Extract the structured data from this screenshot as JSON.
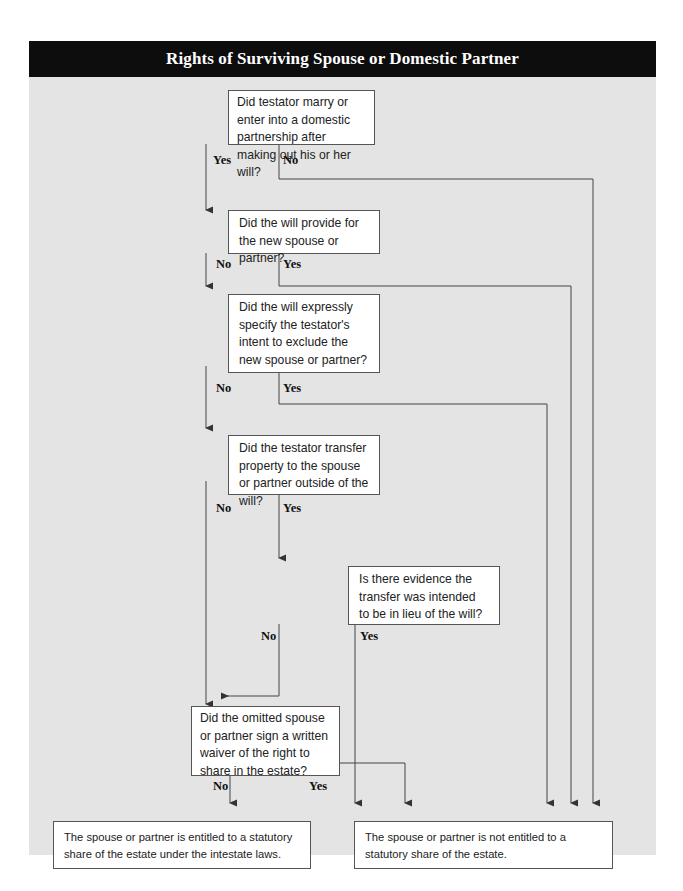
{
  "title": "Rights of Surviving Spouse or Domestic Partner",
  "nodes": {
    "q1": "Did testator marry or enter into a domestic partnership after making out his or her will?",
    "q2": "Did the will provide for the new spouse or partner?",
    "q3": "Did the will expressly specify the testator's intent to exclude the new spouse or partner?",
    "q4": "Did the testator transfer property to the spouse or partner outside of the will?",
    "q5": "Is there evidence the transfer was intended to be in lieu of the will?",
    "q6": "Did the omitted spouse or partner sign a written waiver of the right to share in the estate?",
    "outcome_entitled": "The spouse or partner is entitled to a statutory share of the estate under the intestate laws.",
    "outcome_not_entitled": "The spouse or partner is not entitled to a statutory share of the estate."
  },
  "labels": {
    "q1_yes": "Yes",
    "q1_no": "No",
    "q2_no": "No",
    "q2_yes": "Yes",
    "q3_no": "No",
    "q3_yes": "Yes",
    "q4_no": "No",
    "q4_yes": "Yes",
    "q5_no": "No",
    "q5_yes": "Yes",
    "q6_no": "No",
    "q6_yes": "Yes"
  },
  "colors": {
    "title_bar": "#0d0d0d",
    "panel": "#e4e4e4",
    "line": "#444444"
  }
}
